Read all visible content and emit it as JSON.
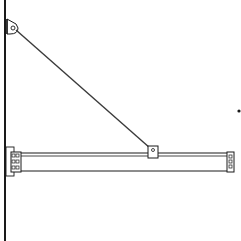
{
  "diagram": {
    "type": "technical-line-drawing",
    "colors": {
      "background": "#ffffff",
      "stroke": "#1a1a1a",
      "rod": "#3a3a3a",
      "beam_fill": "#ffffff"
    },
    "components": [
      {
        "id": "wall",
        "label": ""
      },
      {
        "id": "upper-wall-bracket",
        "label": ""
      },
      {
        "id": "tie-rod",
        "label": ""
      },
      {
        "id": "rod-beam-clamp",
        "label": ""
      },
      {
        "id": "horizontal-beam",
        "label": ""
      },
      {
        "id": "beam-wall-mount",
        "label": ""
      },
      {
        "id": "beam-end-cap",
        "label": ""
      },
      {
        "id": "stray-dot",
        "label": ""
      }
    ]
  }
}
